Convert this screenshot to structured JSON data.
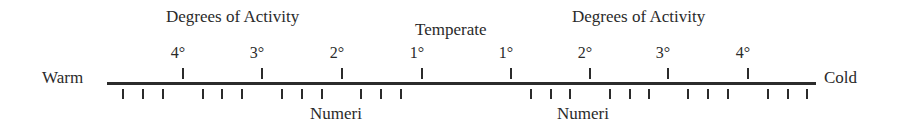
{
  "chart_data": {
    "type": "diagram",
    "left_end_label": "Warm",
    "right_end_label": "Cold",
    "center_label": "Temperate",
    "upper_group_label": "Degrees of Activity",
    "lower_group_label": "Numeri",
    "left_degrees": [
      "4°",
      "3°",
      "2°",
      "1°"
    ],
    "right_degrees": [
      "1°",
      "2°",
      "3°",
      "4°"
    ],
    "numeri_per_degree": 3,
    "total_numeri_ticks": 24
  },
  "labels": {
    "title_left": "Degrees of Activity",
    "title_right": "Degrees of Activity",
    "temperate": "Temperate",
    "warm": "Warm",
    "cold": "Cold",
    "numeri_left": "Numeri",
    "numeri_right": "Numeri"
  },
  "degrees": [
    {
      "label": "4°",
      "x": 183
    },
    {
      "label": "3°",
      "x": 262
    },
    {
      "label": "2°",
      "x": 342
    },
    {
      "label": "1°",
      "x": 422
    },
    {
      "label": "1°",
      "x": 511
    },
    {
      "label": "2°",
      "x": 590
    },
    {
      "label": "3°",
      "x": 668
    },
    {
      "label": "4°",
      "x": 748
    }
  ],
  "numeri_ticks_x": [
    123,
    143,
    163,
    203,
    222,
    242,
    282,
    302,
    322,
    361,
    381,
    401,
    531,
    551,
    570,
    610,
    630,
    649,
    688,
    708,
    728,
    768,
    788,
    807
  ]
}
